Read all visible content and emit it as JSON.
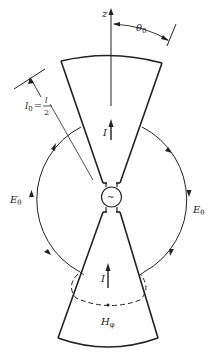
{
  "diagram": {
    "labels": {
      "z_axis": "z",
      "theta0": "θ",
      "theta0_sub": "0",
      "l0_l": "l",
      "l0_sub": "0",
      "l0_eq": "=",
      "l0_num": "l",
      "l0_den": "2",
      "current_upper": "I",
      "current_lower": "I",
      "e_theta_left": "E",
      "e_theta_left_sub": "θ",
      "e_theta_right": "E",
      "e_theta_right_sub": "θ",
      "h_phi": "H",
      "h_phi_sub": "φ",
      "source": "~"
    },
    "colors": {
      "line": "#222222",
      "background": "#ffffff"
    }
  }
}
